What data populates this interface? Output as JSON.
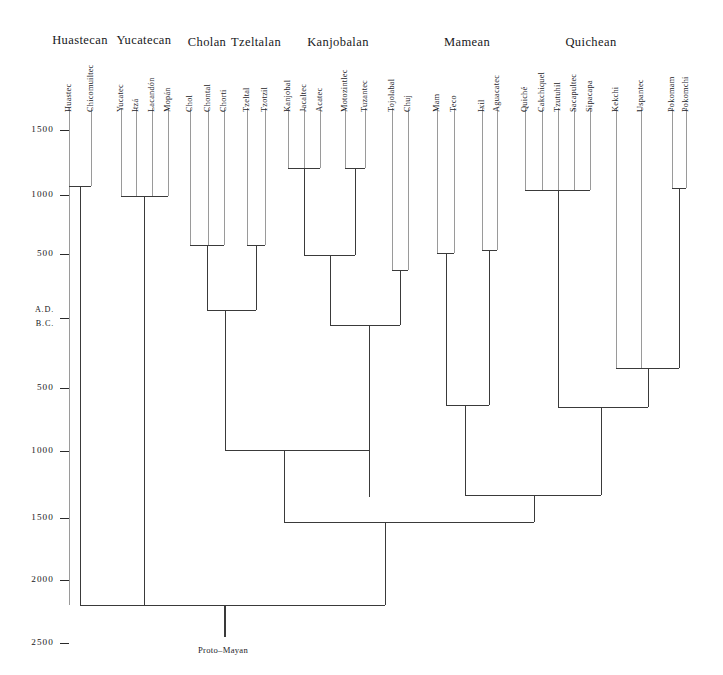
{
  "figure": {
    "root_label": "Proto–Mayan",
    "root_label_x": 198,
    "root_label_y": 645,
    "line_color": "#3a3a3a",
    "leaf_line_color": "#9a9a9a",
    "background": "#ffffff"
  },
  "axis": {
    "era_upper": "A.D.",
    "era_lower": "B.C.",
    "ticks": [
      {
        "label": "1500",
        "y": 130
      },
      {
        "label": "1000",
        "y": 195
      },
      {
        "label": "500",
        "y": 254
      },
      {
        "label": "A.D.",
        "y": 311
      },
      {
        "label": "B.C.",
        "y": 325
      },
      {
        "label": "500",
        "y": 388
      },
      {
        "label": "1000",
        "y": 451
      },
      {
        "label": "1500",
        "y": 518
      },
      {
        "label": "2000",
        "y": 580
      },
      {
        "label": "2500",
        "y": 643
      }
    ],
    "dash_x": 60,
    "label_right": 54
  },
  "groups": [
    {
      "name": "Huastecan",
      "x": 80,
      "y": 33
    },
    {
      "name": "Yucatecan",
      "x": 144,
      "y": 33
    },
    {
      "name": "Cholan",
      "x": 207,
      "y": 35
    },
    {
      "name": "Tzeltalan",
      "x": 256,
      "y": 35
    },
    {
      "name": "Kanjobalan",
      "x": 338,
      "y": 35
    },
    {
      "name": "Mamean",
      "x": 467,
      "y": 35
    },
    {
      "name": "Quichean",
      "x": 591,
      "y": 35
    }
  ],
  "leaves": [
    {
      "name": "Huastec",
      "x": 69,
      "top": 74,
      "tip": 108,
      "end": 605
    },
    {
      "name": "Chicomuiltec",
      "x": 91,
      "top": 74,
      "tip": 108,
      "end": 186
    },
    {
      "name": "Yucatec",
      "x": 121,
      "top": 76,
      "tip": 108,
      "end": 196
    },
    {
      "name": "Itzá",
      "x": 136,
      "top": 82,
      "tip": 108,
      "end": 196
    },
    {
      "name": "Lacandón",
      "x": 152,
      "top": 74,
      "tip": 108,
      "end": 196
    },
    {
      "name": "Mopán",
      "x": 168,
      "top": 78,
      "tip": 108,
      "end": 196
    },
    {
      "name": "Chol",
      "x": 190,
      "top": 78,
      "tip": 108,
      "end": 245
    },
    {
      "name": "Chontal",
      "x": 208,
      "top": 74,
      "tip": 108,
      "end": 245
    },
    {
      "name": "Chorti",
      "x": 224,
      "top": 76,
      "tip": 108,
      "end": 245
    },
    {
      "name": "Tzeltal",
      "x": 247,
      "top": 76,
      "tip": 108,
      "end": 245
    },
    {
      "name": "Tzotzil",
      "x": 265,
      "top": 76,
      "tip": 108,
      "end": 245
    },
    {
      "name": "Kanjobal",
      "x": 288,
      "top": 74,
      "tip": 108,
      "end": 168
    },
    {
      "name": "Jacaltec",
      "x": 304,
      "top": 78,
      "tip": 108,
      "end": 168
    },
    {
      "name": "Acatec",
      "x": 320,
      "top": 82,
      "tip": 108,
      "end": 168
    },
    {
      "name": "Motozintlec",
      "x": 345,
      "top": 68,
      "tip": 108,
      "end": 168
    },
    {
      "name": "Tuzantec",
      "x": 365,
      "top": 76,
      "tip": 108,
      "end": 168
    },
    {
      "name": "Tojolabal",
      "x": 392,
      "top": 74,
      "tip": 108,
      "end": 270
    },
    {
      "name": "Chuj",
      "x": 408,
      "top": 84,
      "tip": 108,
      "end": 270
    },
    {
      "name": "Mam",
      "x": 437,
      "top": 82,
      "tip": 108,
      "end": 253
    },
    {
      "name": "Teco",
      "x": 454,
      "top": 82,
      "tip": 108,
      "end": 253
    },
    {
      "name": "Ixil",
      "x": 482,
      "top": 86,
      "tip": 108,
      "end": 250
    },
    {
      "name": "Aguacatec",
      "x": 497,
      "top": 74,
      "tip": 108,
      "end": 250
    },
    {
      "name": "Quiché",
      "x": 525,
      "top": 76,
      "tip": 108,
      "end": 190
    },
    {
      "name": "Cakchiquel",
      "x": 542,
      "top": 70,
      "tip": 108,
      "end": 190
    },
    {
      "name": "Tzutuhil",
      "x": 558,
      "top": 74,
      "tip": 108,
      "end": 190
    },
    {
      "name": "Sacapultec",
      "x": 574,
      "top": 72,
      "tip": 108,
      "end": 190
    },
    {
      "name": "Sipacapa",
      "x": 590,
      "top": 76,
      "tip": 108,
      "end": 190
    },
    {
      "name": "Kekchi",
      "x": 616,
      "top": 78,
      "tip": 108,
      "end": 368
    },
    {
      "name": "Uspantec",
      "x": 641,
      "top": 76,
      "tip": 108,
      "end": 368
    },
    {
      "name": "Pokomam",
      "x": 672,
      "top": 74,
      "tip": 108,
      "end": 188
    },
    {
      "name": "Pokomchi",
      "x": 686,
      "top": 76,
      "tip": 108,
      "end": 188
    }
  ],
  "nodes": [
    {
      "id": "huastecan",
      "x1": 69,
      "x2": 91,
      "y": 186,
      "stem_x": 80,
      "stem_to": 605
    },
    {
      "id": "yucatecan",
      "x1": 121,
      "x2": 168,
      "y": 196,
      "stem_x": 144,
      "stem_to": 605
    },
    {
      "id": "cholan",
      "x1": 190,
      "x2": 224,
      "y": 245,
      "stem_x": 207,
      "stem_to": 310
    },
    {
      "id": "tzeltalan",
      "x1": 247,
      "x2": 265,
      "y": 245,
      "stem_x": 256,
      "stem_to": 310
    },
    {
      "id": "cholan-tzelt",
      "x1": 207,
      "x2": 256,
      "y": 310,
      "stem_x": 225,
      "stem_to": 450
    },
    {
      "id": "kanjobal-core",
      "x1": 288,
      "x2": 320,
      "y": 168,
      "stem_x": 304,
      "stem_to": 255
    },
    {
      "id": "moto-tuz",
      "x1": 345,
      "x2": 365,
      "y": 168,
      "stem_x": 355,
      "stem_to": 255
    },
    {
      "id": "kanjobalan-a",
      "x1": 304,
      "x2": 355,
      "y": 255,
      "stem_x": 330,
      "stem_to": 325
    },
    {
      "id": "tojo-chuj",
      "x1": 392,
      "x2": 408,
      "y": 270,
      "stem_x": 400,
      "stem_to": 325
    },
    {
      "id": "kanjobalan",
      "x1": 330,
      "x2": 400,
      "y": 325,
      "stem_x": 369,
      "stem_to": 497
    },
    {
      "id": "chol-kanjob",
      "x1": 225,
      "x2": 369,
      "y": 450,
      "stem_x": 284,
      "stem_to": 522
    },
    {
      "id": "mam-teco",
      "x1": 437,
      "x2": 454,
      "y": 253,
      "stem_x": 446,
      "stem_to": 405
    },
    {
      "id": "ixil-agua",
      "x1": 482,
      "x2": 497,
      "y": 250,
      "stem_x": 489,
      "stem_to": 405
    },
    {
      "id": "mamean",
      "x1": 446,
      "x2": 489,
      "y": 405,
      "stem_x": 465,
      "stem_to": 495
    },
    {
      "id": "quiche-core",
      "x1": 525,
      "x2": 590,
      "y": 190,
      "stem_x": 558,
      "stem_to": 407
    },
    {
      "id": "pokom",
      "x1": 672,
      "x2": 686,
      "y": 188,
      "stem_x": 679,
      "stem_to": 368
    },
    {
      "id": "kek-usp-pok",
      "x1": 616,
      "x2": 679,
      "y": 368,
      "stem_x": 648,
      "stem_to": 407
    },
    {
      "id": "quichean",
      "x1": 558,
      "x2": 648,
      "y": 407,
      "stem_x": 601,
      "stem_to": 495
    },
    {
      "id": "mam-quich",
      "x1": 465,
      "x2": 601,
      "y": 495,
      "stem_x": 534,
      "stem_to": 522
    },
    {
      "id": "eastern-west",
      "x1": 284,
      "x2": 534,
      "y": 522,
      "stem_x": 385,
      "stem_to": 605
    },
    {
      "id": "proto-mayan",
      "x1": 80,
      "x2": 385,
      "y": 605,
      "stem_x": 225,
      "stem_to": 637
    }
  ]
}
